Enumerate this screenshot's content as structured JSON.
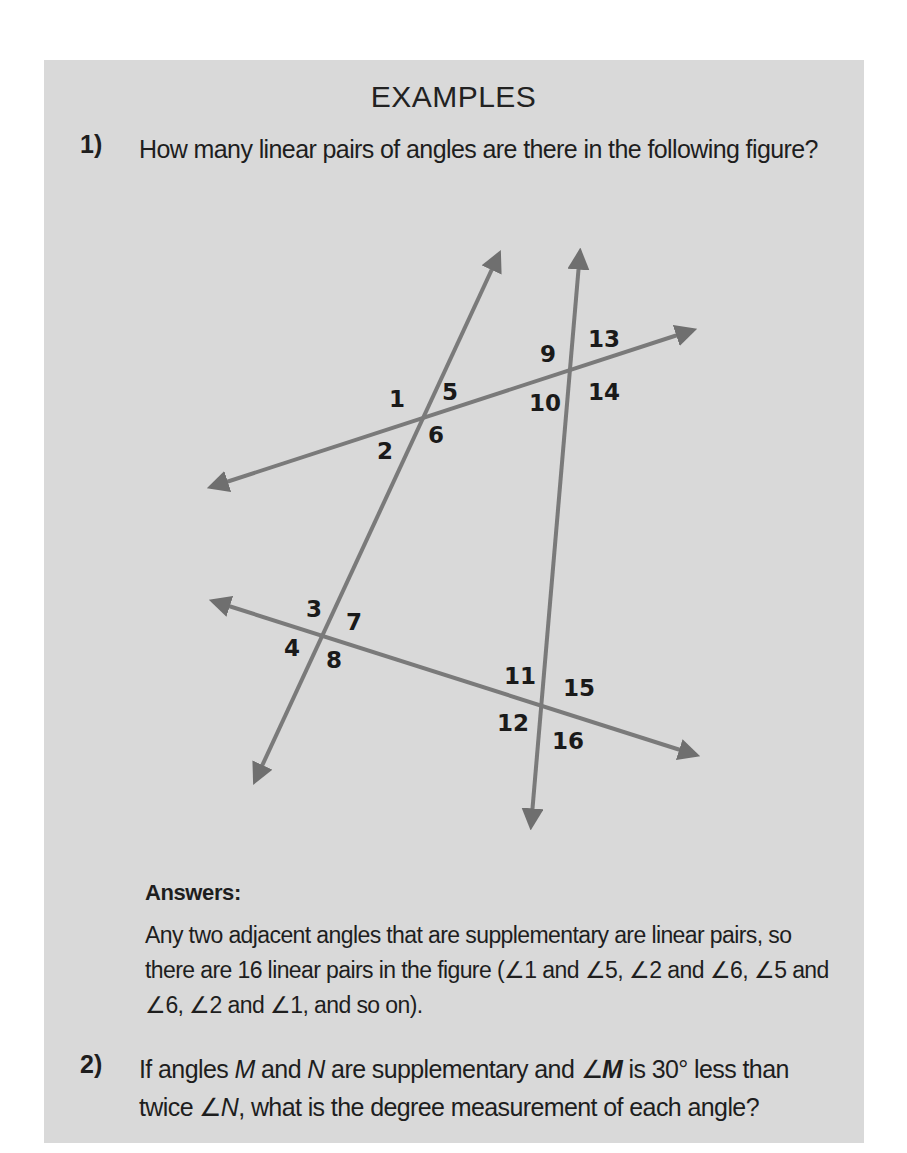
{
  "section_title": "EXAMPLES",
  "examples": [
    {
      "number": "1)",
      "question": "How many linear pairs of angles are there in the following figure?",
      "answer_heading": "Answers:",
      "answer": "Any two adjacent angles that are supplementary are linear pairs, so there are 16 linear pairs in the figure (∠1 and ∠5, ∠2 and ∠6, ∠5 and ∠6, ∠2 and ∠1, and so on)."
    },
    {
      "number": "2)",
      "question_parts": {
        "p1": "If angles ",
        "m": "M",
        "p2": " and ",
        "n": "N",
        "p3": " are supplementary and ∠",
        "m_bold": "M",
        "p4": " is 30° less than twice ∠",
        "n2": "N",
        "p5": ", what is the degree measurement of each angle?"
      }
    }
  ],
  "figure": {
    "line_color": "#777777",
    "angle_labels": [
      "1",
      "2",
      "3",
      "4",
      "5",
      "6",
      "7",
      "8",
      "9",
      "10",
      "11",
      "12",
      "13",
      "14",
      "15",
      "16"
    ]
  },
  "colors": {
    "box_background": "#d9d9d9",
    "text": "#1e1e1e"
  }
}
